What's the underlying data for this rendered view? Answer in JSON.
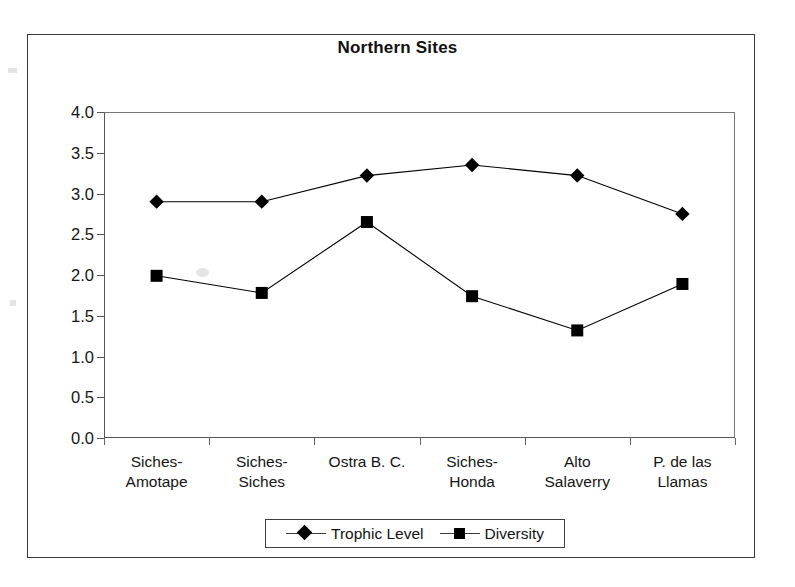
{
  "figure": {
    "title": "Northern Sites"
  },
  "chart_data": {
    "type": "line",
    "title": "Northern Sites",
    "xlabel": "",
    "ylabel": "",
    "ylim": [
      0.0,
      4.0
    ],
    "ytick_labels": [
      "4.0",
      "3.5",
      "3.0",
      "2.5",
      "2.0",
      "1.5",
      "1.0",
      "0.5",
      "0.0"
    ],
    "ytick_values": [
      4.0,
      3.5,
      3.0,
      2.5,
      2.0,
      1.5,
      1.0,
      0.5,
      0.0
    ],
    "grid": false,
    "legend_position": "bottom",
    "categories": [
      "Siches-\nAmotape",
      "Siches-\nSiches",
      "Ostra B. C.",
      "Siches-\nHonda",
      "Alto\nSalaverry",
      "P. de las\nLlamas"
    ],
    "category_labels": [
      [
        "Siches-",
        "Amotape"
      ],
      [
        "Siches-",
        "Siches"
      ],
      [
        "Ostra B. C.",
        ""
      ],
      [
        "Siches-",
        "Honda"
      ],
      [
        "Alto",
        "Salaverry"
      ],
      [
        "P. de las",
        "Llamas"
      ]
    ],
    "series": [
      {
        "name": "Trophic Level",
        "marker": "diamond",
        "color": "#000000",
        "values": [
          2.9,
          2.9,
          3.22,
          3.35,
          3.22,
          2.75
        ]
      },
      {
        "name": "Diversity",
        "marker": "square",
        "color": "#000000",
        "values": [
          1.99,
          1.78,
          2.65,
          1.74,
          1.32,
          1.89
        ]
      }
    ]
  },
  "legend": {
    "entries": [
      {
        "label": "Trophic Level",
        "marker": "diamond"
      },
      {
        "label": "Diversity",
        "marker": "square"
      }
    ]
  },
  "colors": {
    "series": "#000000",
    "axis": "#555555",
    "frame": "#3a3a3a",
    "background": "#ffffff"
  }
}
